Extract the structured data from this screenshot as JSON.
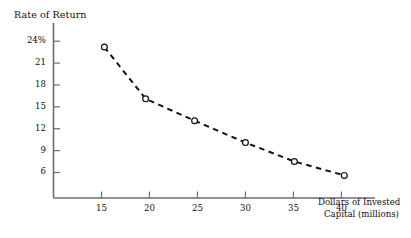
{
  "chart_data": {
    "type": "line",
    "title": "Rate of Return",
    "xlabel": "Dollars of Invested Capital (millions)",
    "xlabel_line1": "Dollars of Invested",
    "xlabel_line2": "Capital (millions)",
    "ylabel": "Rate of Return",
    "x": [
      15.3,
      19.6,
      24.7,
      30.0,
      35.1,
      40.3
    ],
    "values": [
      23.2,
      16.1,
      13.1,
      10.1,
      7.5,
      5.6
    ],
    "series": [
      {
        "name": "Rate of Return",
        "x": [
          15.3,
          19.6,
          24.7,
          30.0,
          35.1,
          40.3
        ],
        "values": [
          23.2,
          16.1,
          13.1,
          10.1,
          7.5,
          5.6
        ]
      }
    ],
    "xlim": [
      10.0,
      43.5
    ],
    "ylim": [
      2.5,
      26.5
    ],
    "xticks": [
      15,
      20,
      25,
      30,
      35,
      40
    ],
    "xtick_labels": [
      "15",
      "20",
      "25",
      "30",
      "35",
      "40"
    ],
    "yticks": [
      24,
      21,
      18,
      15,
      12,
      9,
      6
    ],
    "ytick_labels": [
      "24%",
      "21",
      "18",
      "15",
      "12",
      "9",
      "6"
    ],
    "grid": false,
    "legend": false,
    "line_style": "dashed",
    "marker": "circle-open",
    "line_color": "#111111",
    "axis_color": "#6d6d6d",
    "background": "#ffffff"
  }
}
